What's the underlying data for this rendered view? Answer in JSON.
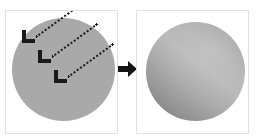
{
  "figure": {
    "background_color": "#ffffff",
    "panel_border_color": "#e2e2e2",
    "transition": {
      "icon": "right-arrow-icon",
      "label": "becomes",
      "color": "#141414"
    }
  },
  "panels": [
    {
      "id": "before",
      "name": "flat-sphere-panel",
      "caption": "",
      "sphere": {
        "name": "flat-shaded-sphere",
        "fill": "#a9a9a9",
        "shading": "flat",
        "diameter_px": 103
      },
      "light_rays": [
        {
          "label": "light-ray-1",
          "style": "dotted",
          "color": "#1a1a1a",
          "direction_deg": -36,
          "arrowhead": "chevron-down-left"
        },
        {
          "label": "light-ray-2",
          "style": "dotted",
          "color": "#1a1a1a",
          "direction_deg": -36,
          "arrowhead": "chevron-down-left"
        },
        {
          "label": "light-ray-3",
          "style": "dotted",
          "color": "#1a1a1a",
          "direction_deg": -36,
          "arrowhead": "chevron-down-left"
        }
      ]
    },
    {
      "id": "after",
      "name": "shaded-sphere-panel",
      "caption": "",
      "sphere": {
        "name": "gradient-shaded-sphere",
        "shading": "diagonal-gradient",
        "highlight_color": "#b9b9b9",
        "shadow_color": "#8b8b8b",
        "gradient_angle_deg": 218,
        "diameter_px": 99
      },
      "light_rays": []
    }
  ]
}
